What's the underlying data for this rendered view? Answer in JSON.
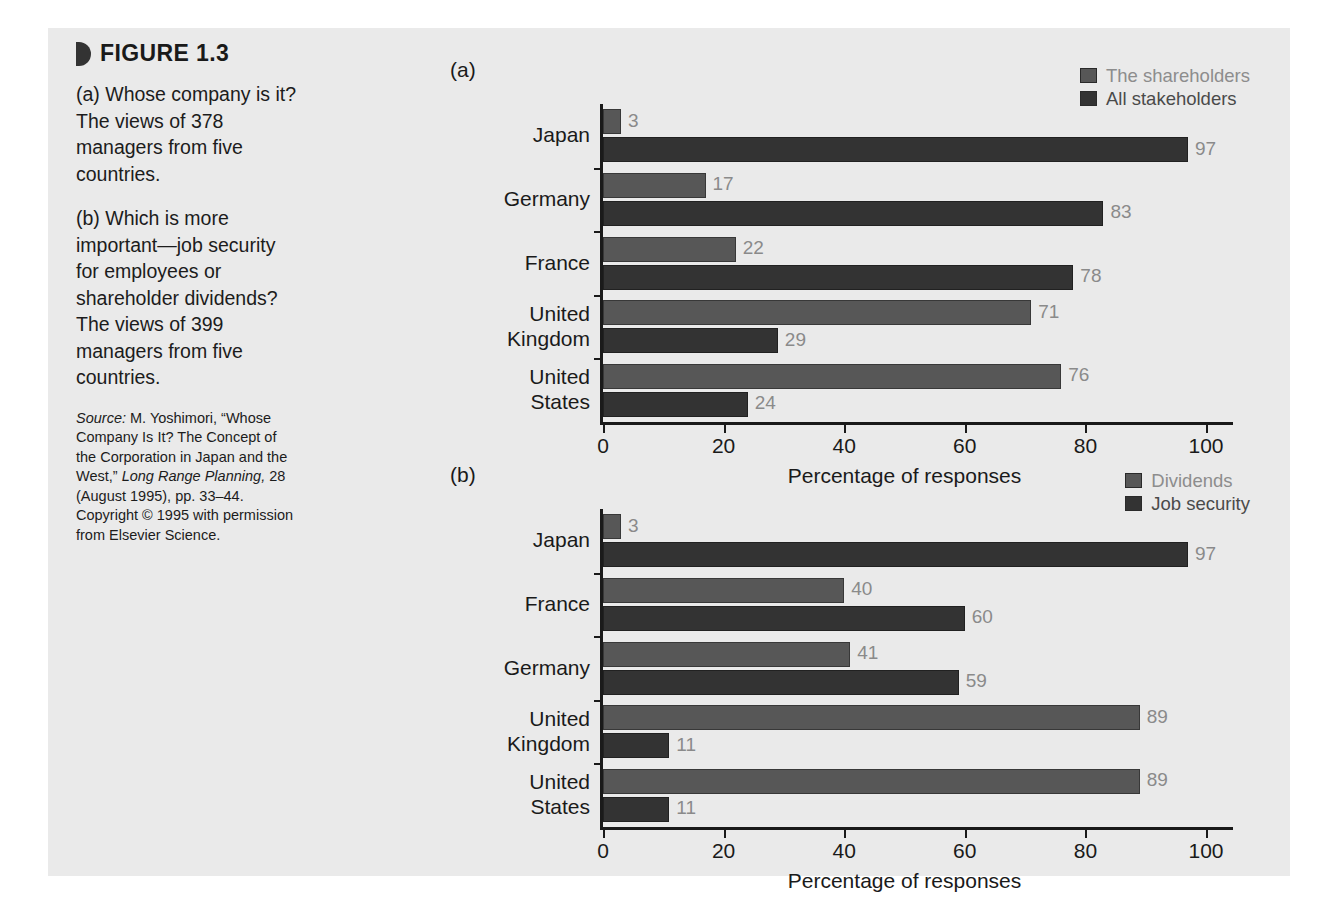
{
  "figure": {
    "title": "FIGURE 1.3",
    "caption_a": "(a) Whose company is it? The views of 378 managers from five countries.",
    "caption_a_prefix": "a",
    "caption_b": "(b) Which is more important—job security for employees or shareholder dividends? The views of 399 managers from five countries.",
    "caption_b_prefix": "b",
    "source_label": "Source:",
    "source_text_1": " M. Yoshimori, “Whose Company Is It? The Concept of the Corporation in Japan and the West,” ",
    "source_journal": "Long Range Planning,",
    "source_text_2": " 28 (August 1995), pp. 33–44. Copyright © 1995 with permission from Elsevier Science."
  },
  "colors": {
    "panel_background": "#eaeaea",
    "series_a": "#575757",
    "series_b": "#333333",
    "axis": "#1a1a1a",
    "value_label": "#8a8a8a"
  },
  "chart_data": [
    {
      "id": "chart-a",
      "type": "bar",
      "orientation": "horizontal",
      "panel_label": "(a)",
      "title": "",
      "xlabel": "Percentage of responses",
      "ylabel": "",
      "xlim": [
        0,
        100
      ],
      "xticks": [
        0,
        20,
        40,
        60,
        80,
        100
      ],
      "xtick_labels": [
        "0",
        "20",
        "40",
        "60",
        "80",
        "100"
      ],
      "grid": false,
      "legend_position": "top-right",
      "categories": [
        "Japan",
        "Germany",
        "France",
        "United\nKingdom",
        "United\nStates"
      ],
      "series": [
        {
          "name": "The shareholders",
          "color": "#575757",
          "values": [
            3,
            17,
            22,
            71,
            76
          ]
        },
        {
          "name": "All stakeholders",
          "color": "#333333",
          "values": [
            97,
            83,
            78,
            29,
            24
          ]
        }
      ]
    },
    {
      "id": "chart-b",
      "type": "bar",
      "orientation": "horizontal",
      "panel_label": "(b)",
      "title": "",
      "xlabel": "Percentage of responses",
      "ylabel": "",
      "xlim": [
        0,
        100
      ],
      "xticks": [
        0,
        20,
        40,
        60,
        80,
        100
      ],
      "xtick_labels": [
        "0",
        "20",
        "40",
        "60",
        "80",
        "100"
      ],
      "grid": false,
      "legend_position": "top-right",
      "categories": [
        "Japan",
        "France",
        "Germany",
        "United\nKingdom",
        "United\nStates"
      ],
      "series": [
        {
          "name": "Dividends",
          "color": "#575757",
          "values": [
            3,
            40,
            41,
            89,
            89
          ]
        },
        {
          "name": "Job security",
          "color": "#333333",
          "values": [
            97,
            60,
            59,
            11,
            11
          ]
        }
      ]
    }
  ]
}
